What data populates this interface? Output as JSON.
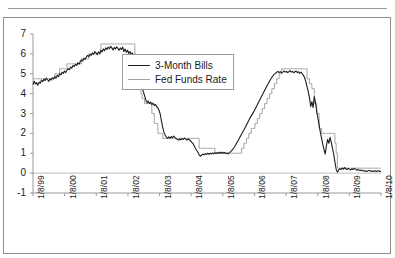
{
  "page": {
    "header_ghost_text": ""
  },
  "chart_data": {
    "type": "line",
    "title": "",
    "xlabel": "",
    "ylabel": "",
    "ylim": [
      -1,
      7
    ],
    "yticks": [
      -1,
      0,
      1,
      2,
      3,
      4,
      5,
      6,
      7
    ],
    "ytick_labels": [
      "-1",
      "0",
      "1",
      "2",
      "3",
      "4",
      "5",
      "6",
      "7"
    ],
    "grid": false,
    "zero_line": true,
    "legend_position": "upper-center-left",
    "x_tick_labels": [
      "1/8/99",
      "1/8/00",
      "1/8/01",
      "1/8/02",
      "1/8/03",
      "1/8/04",
      "1/8/05",
      "1/8/06",
      "1/8/07",
      "1/8/08",
      "1/8/09",
      "1/8/10"
    ],
    "x_range": [
      "1/8/99",
      "1/8/10"
    ],
    "series": [
      {
        "name": "3-Month Bills",
        "color": "#1d1d1d",
        "values": [
          4.45,
          4.62,
          4.48,
          4.55,
          4.42,
          4.58,
          4.52,
          4.68,
          4.6,
          4.72,
          4.66,
          4.78,
          4.7,
          4.62,
          4.74,
          4.68,
          4.8,
          4.74,
          4.86,
          4.78,
          4.92,
          4.85,
          5.0,
          4.94,
          5.08,
          5.02,
          5.14,
          5.06,
          5.18,
          5.26,
          5.2,
          5.34,
          5.28,
          5.42,
          5.36,
          5.48,
          5.42,
          5.55,
          5.48,
          5.62,
          5.7,
          5.64,
          5.78,
          5.72,
          5.85,
          5.92,
          5.86,
          5.98,
          5.92,
          6.05,
          5.98,
          6.12,
          6.05,
          5.96,
          6.1,
          6.02,
          6.18,
          6.1,
          6.25,
          6.16,
          6.3,
          6.22,
          6.34,
          6.26,
          6.38,
          6.3,
          6.2,
          6.32,
          6.24,
          6.36,
          6.28,
          6.18,
          6.3,
          6.22,
          6.34,
          6.12,
          6.24,
          6.08,
          6.18,
          6.02,
          6.12,
          5.95,
          6.05,
          5.85,
          5.7,
          5.45,
          5.2,
          4.95,
          4.7,
          4.48,
          4.3,
          4.1,
          3.9,
          3.7,
          3.55,
          3.62,
          3.5,
          3.58,
          3.45,
          3.52,
          3.4,
          3.46,
          3.34,
          3.28,
          3.15,
          2.95,
          2.6,
          2.3,
          2.05,
          1.92,
          1.8,
          1.75,
          1.82,
          1.76,
          1.84,
          1.78,
          1.86,
          1.8,
          1.74,
          1.7,
          1.66,
          1.72,
          1.68,
          1.74,
          1.7,
          1.76,
          1.71,
          1.66,
          1.72,
          1.68,
          1.62,
          1.55,
          1.48,
          1.36,
          1.24,
          1.14,
          1.05,
          0.92,
          0.85,
          0.9,
          0.96,
          0.92,
          0.98,
          0.94,
          1.0,
          0.95,
          1.01,
          0.96,
          1.02,
          0.97,
          1.03,
          0.98,
          1.04,
          0.99,
          1.05,
          1.0,
          1.06,
          1.0,
          1.04,
          0.98,
          1.02,
          0.97,
          1.03,
          1.08,
          1.14,
          1.22,
          1.3,
          1.4,
          1.52,
          1.62,
          1.74,
          1.85,
          1.96,
          2.08,
          2.18,
          2.3,
          2.42,
          2.54,
          2.66,
          2.78,
          2.88,
          2.98,
          3.08,
          3.2,
          3.32,
          3.44,
          3.56,
          3.68,
          3.8,
          3.92,
          4.04,
          4.16,
          4.28,
          4.4,
          4.5,
          4.62,
          4.72,
          4.82,
          4.9,
          4.98,
          5.02,
          5.08,
          5.12,
          5.06,
          5.1,
          5.04,
          5.08,
          5.14,
          5.08,
          5.12,
          5.06,
          5.1,
          5.16,
          5.08,
          5.12,
          5.05,
          5.1,
          5.14,
          5.06,
          5.1,
          5.02,
          5.08,
          5.0,
          4.92,
          4.8,
          4.6,
          4.35,
          4.1,
          3.8,
          3.35,
          3.6,
          3.3,
          3.85,
          3.55,
          3.1,
          2.75,
          2.4,
          2.05,
          1.75,
          1.45,
          1.2,
          0.95,
          1.4,
          1.7,
          1.5,
          1.8,
          1.55,
          1.25,
          0.95,
          0.55,
          0.2,
          0.05,
          0.15,
          0.22,
          0.18,
          0.26,
          0.2,
          0.28,
          0.22,
          0.18,
          0.24,
          0.2,
          0.16,
          0.22,
          0.18,
          0.24,
          0.2,
          0.15,
          0.18,
          0.14,
          0.16,
          0.12,
          0.14,
          0.1,
          0.12,
          0.08,
          0.1,
          0.14,
          0.1,
          0.12,
          0.08,
          0.1,
          0.12,
          0.08,
          0.1,
          0.12,
          0.08,
          0.1
        ]
      },
      {
        "name": "Fed Funds Rate",
        "color": "#a3a3a3",
        "values": [
          4.75,
          4.75,
          4.75,
          4.75,
          4.75,
          4.75,
          4.75,
          4.75,
          4.75,
          4.75,
          4.75,
          4.75,
          4.75,
          4.75,
          4.75,
          4.75,
          4.75,
          4.75,
          5.0,
          5.0,
          5.0,
          5.0,
          5.25,
          5.25,
          5.25,
          5.25,
          5.25,
          5.25,
          5.5,
          5.5,
          5.5,
          5.5,
          5.5,
          5.5,
          5.5,
          5.5,
          5.5,
          5.5,
          5.5,
          5.5,
          5.75,
          5.75,
          5.75,
          5.75,
          5.75,
          5.75,
          6.0,
          6.0,
          6.0,
          6.0,
          6.0,
          6.0,
          6.0,
          6.0,
          6.0,
          6.0,
          6.5,
          6.5,
          6.5,
          6.5,
          6.5,
          6.5,
          6.5,
          6.5,
          6.5,
          6.5,
          6.5,
          6.5,
          6.5,
          6.5,
          6.5,
          6.5,
          6.5,
          6.5,
          6.5,
          6.5,
          6.5,
          6.5,
          6.5,
          6.5,
          6.5,
          6.5,
          6.5,
          6.5,
          6.0,
          5.5,
          5.0,
          4.5,
          4.5,
          4.0,
          3.75,
          3.75,
          3.5,
          3.5,
          3.5,
          3.5,
          3.5,
          3.5,
          3.0,
          3.0,
          2.5,
          2.5,
          2.5,
          2.0,
          2.0,
          2.0,
          2.0,
          1.75,
          1.75,
          1.75,
          1.75,
          1.75,
          1.75,
          1.75,
          1.75,
          1.75,
          1.75,
          1.75,
          1.75,
          1.75,
          1.75,
          1.75,
          1.75,
          1.75,
          1.75,
          1.75,
          1.75,
          1.75,
          1.75,
          1.75,
          1.75,
          1.75,
          1.75,
          1.75,
          1.75,
          1.75,
          1.75,
          1.25,
          1.25,
          1.25,
          1.25,
          1.25,
          1.25,
          1.25,
          1.25,
          1.25,
          1.25,
          1.25,
          1.25,
          1.25,
          1.0,
          1.0,
          1.0,
          1.0,
          1.0,
          1.0,
          1.0,
          1.0,
          1.0,
          1.0,
          1.0,
          1.0,
          1.0,
          1.0,
          1.0,
          1.0,
          1.0,
          1.0,
          1.0,
          1.0,
          1.0,
          1.0,
          1.25,
          1.25,
          1.5,
          1.5,
          1.75,
          1.75,
          2.0,
          2.0,
          2.25,
          2.25,
          2.25,
          2.5,
          2.5,
          2.75,
          2.75,
          3.0,
          3.0,
          3.25,
          3.25,
          3.5,
          3.5,
          3.75,
          3.75,
          4.0,
          4.0,
          4.25,
          4.25,
          4.5,
          4.5,
          4.75,
          4.75,
          5.0,
          5.0,
          5.25,
          5.25,
          5.25,
          5.25,
          5.25,
          5.25,
          5.25,
          5.25,
          5.25,
          5.25,
          5.25,
          5.25,
          5.25,
          5.25,
          5.25,
          5.25,
          5.25,
          5.25,
          5.25,
          5.25,
          5.25,
          4.75,
          4.75,
          4.5,
          4.5,
          4.25,
          4.25,
          3.5,
          3.5,
          3.0,
          3.0,
          2.25,
          2.25,
          2.0,
          2.0,
          2.0,
          2.0,
          2.0,
          2.0,
          2.0,
          2.0,
          2.0,
          2.0,
          2.0,
          1.5,
          1.0,
          0.25,
          0.25,
          0.25,
          0.25,
          0.25,
          0.25,
          0.25,
          0.25,
          0.25,
          0.25,
          0.25,
          0.25,
          0.25,
          0.25,
          0.25,
          0.25,
          0.25,
          0.25,
          0.25,
          0.25,
          0.25,
          0.25,
          0.25,
          0.25,
          0.25,
          0.25,
          0.25,
          0.25,
          0.25,
          0.25,
          0.25,
          0.25,
          0.25,
          0.25,
          0.25,
          0.25,
          0.25
        ]
      }
    ]
  }
}
